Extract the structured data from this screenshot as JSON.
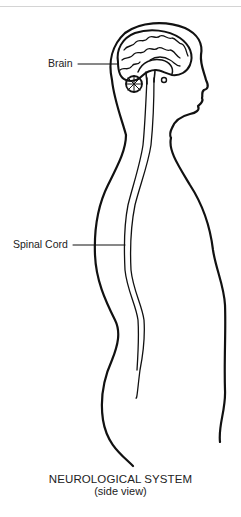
{
  "diagram": {
    "title": "NEUROLOGICAL SYSTEM",
    "subtitle": "(side view)",
    "labels": [
      {
        "id": "brain",
        "text": "Brain"
      },
      {
        "id": "spinal-cord",
        "text": "Spinal Cord"
      }
    ],
    "colors": {
      "line": "#111111",
      "text": "#222222",
      "background": "#ffffff"
    }
  }
}
